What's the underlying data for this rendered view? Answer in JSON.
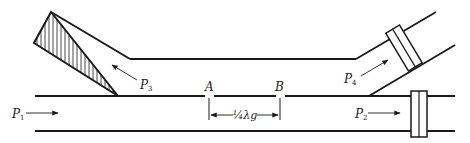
{
  "diagram": {
    "type": "waveguide directional coupler",
    "ports": [
      {
        "id": "P1",
        "label": "P",
        "sub": "1",
        "direction": "input, right"
      },
      {
        "id": "P2",
        "label": "P",
        "sub": "2",
        "direction": "output, right"
      },
      {
        "id": "P3",
        "label": "P",
        "sub": "3",
        "direction": "coupled back, terminated"
      },
      {
        "id": "P4",
        "label": "P",
        "sub": "4",
        "direction": "coupled forward"
      }
    ],
    "points": [
      {
        "id": "A",
        "label": "A"
      },
      {
        "id": "B",
        "label": "B"
      }
    ],
    "spacing_label": "¼λg",
    "colors": {
      "line": "#1a1a1a",
      "background": "#ffffff"
    }
  }
}
